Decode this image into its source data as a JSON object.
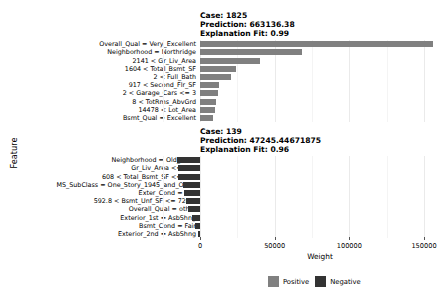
{
  "axes": {
    "ylabel": "Feature",
    "xlabel": "Weight"
  },
  "legend": {
    "items": [
      {
        "label": "Positive",
        "color": "#808080"
      },
      {
        "label": "Negative",
        "color": "#333333"
      }
    ]
  },
  "chart_data": {
    "type": "bar",
    "orientation": "horizontal",
    "title": "",
    "xlabel": "Weight",
    "ylabel": "Feature",
    "xlim": [
      -25000,
      175000
    ],
    "xticks": [
      0,
      50000,
      100000,
      150000
    ],
    "xtick_labels": [
      "0",
      "50000",
      "100000",
      "150000"
    ],
    "grid": true,
    "legend_position": "bottom",
    "panels": [
      {
        "case": "Case: 1825",
        "prediction": "Prediction: 663136.38",
        "explanation_fit": "Explanation Fit: 0.99",
        "case_id": 1825,
        "prediction_value": 663136.38,
        "fit": 0.99,
        "categories": [
          "Overall_Qual = Very_Excellent",
          "Neighborhood = Northridge",
          "2141 < Gr_Liv_Area",
          "1604 < Total_Bsmt_SF",
          "2 < Full_Bath",
          "917 < Second_Flr_SF",
          "2 < Garage_Cars <= 3",
          "8 < TotRms_AbvGrd",
          "14478 < Lot_Area",
          "Bsmt_Qual = Excellent"
        ],
        "values": [
          156000,
          68000,
          40000,
          24000,
          21000,
          13000,
          12000,
          11000,
          10000,
          8500
        ],
        "signs": [
          "positive",
          "positive",
          "positive",
          "positive",
          "positive",
          "positive",
          "positive",
          "positive",
          "positive",
          "positive"
        ]
      },
      {
        "case": "Case: 139",
        "prediction": "Prediction: 47245.44671875",
        "explanation_fit": "Explanation Fit: 0.96",
        "case_id": 139,
        "prediction_value": 47245.44671875,
        "fit": 0.96,
        "categories": [
          "Neighborhood = Old_Town",
          "Gr_Liv_Area <= 933",
          "608 < Total_Bsmt_SF <= 742",
          "MS_SubClass = One_Story_1945_and_Older",
          "Exter_Cond = Fair",
          "592.8 < Bsmt_Unf_SF <= 728.0",
          "Overall_Qual = other",
          "Exterior_1st = AsbShng",
          "Bsmt_Cond = Fair",
          "Exterior_2nd = AsbShng"
        ],
        "values": [
          -15500,
          -15000,
          -14500,
          -11500,
          -11000,
          -9500,
          -8000,
          -5500,
          -3500,
          -1500
        ],
        "signs": [
          "negative",
          "negative",
          "negative",
          "negative",
          "negative",
          "negative",
          "negative",
          "negative",
          "negative",
          "negative"
        ]
      }
    ]
  }
}
